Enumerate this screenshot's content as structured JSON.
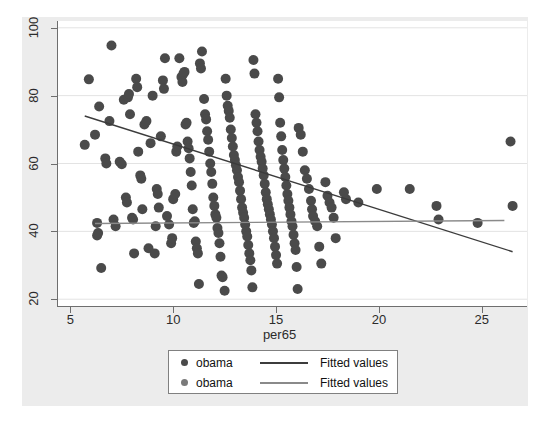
{
  "figure": {
    "background_color": "#ececec",
    "plot_background_color": "#ffffff",
    "gridline_color": "#e3e3e3",
    "axis_color": "#6e6e6e"
  },
  "axes": {
    "x_title": "per65",
    "x_ticks": [
      "5",
      "10",
      "15",
      "20",
      "25"
    ],
    "y_ticks": [
      "20",
      "40",
      "60",
      "80",
      "100"
    ]
  },
  "legend": {
    "rows": [
      {
        "marker_label": "obama",
        "line_label": "Fitted values",
        "marker_color": "#4a4a4a",
        "line_color": "#3c3c3c"
      },
      {
        "marker_label": "obama",
        "line_label": "Fitted values",
        "marker_color": "#7a7a7a",
        "line_color": "#8a8a8a"
      }
    ]
  },
  "chart_data": {
    "type": "scatter",
    "title": "",
    "subtitle": "",
    "xlabel": "per65",
    "ylabel": "",
    "xlim": [
      4.4,
      27.2
    ],
    "ylim": [
      18.0,
      102.0
    ],
    "xticks": [
      5,
      10,
      15,
      20,
      25
    ],
    "yticks": [
      20,
      40,
      60,
      80,
      100
    ],
    "grid": true,
    "grid_axis": "y",
    "legend_position": "below-plot",
    "marker_color": "#4a4a4a",
    "marker_size": 5,
    "series": [
      {
        "name": "obama",
        "type": "scatter",
        "color": "#4a4a4a",
        "points": [
          [
            5.7,
            65.5
          ],
          [
            5.9,
            84.8
          ],
          [
            6.2,
            68.5
          ],
          [
            6.3,
            42.5
          ],
          [
            6.3,
            38.8
          ],
          [
            6.35,
            39.5
          ],
          [
            6.4,
            76.8
          ],
          [
            6.5,
            29.2
          ],
          [
            6.7,
            61.5
          ],
          [
            6.75,
            60.0
          ],
          [
            6.9,
            72.5
          ],
          [
            7.0,
            94.8
          ],
          [
            7.1,
            43.5
          ],
          [
            7.2,
            41.5
          ],
          [
            7.4,
            60.5
          ],
          [
            7.5,
            59.8
          ],
          [
            7.6,
            78.8
          ],
          [
            7.7,
            50.0
          ],
          [
            7.75,
            48.5
          ],
          [
            7.8,
            79.5
          ],
          [
            7.85,
            80.5
          ],
          [
            7.9,
            74.5
          ],
          [
            8.0,
            44.0
          ],
          [
            8.05,
            43.5
          ],
          [
            8.1,
            33.5
          ],
          [
            8.2,
            85.0
          ],
          [
            8.25,
            82.5
          ],
          [
            8.3,
            63.5
          ],
          [
            8.4,
            56.5
          ],
          [
            8.45,
            55.5
          ],
          [
            8.5,
            46.5
          ],
          [
            8.6,
            71.5
          ],
          [
            8.7,
            72.5
          ],
          [
            8.8,
            35.0
          ],
          [
            8.9,
            66.0
          ],
          [
            9.0,
            80.0
          ],
          [
            9.1,
            33.5
          ],
          [
            9.15,
            41.5
          ],
          [
            9.2,
            52.5
          ],
          [
            9.25,
            51.0
          ],
          [
            9.3,
            47.0
          ],
          [
            9.4,
            68.0
          ],
          [
            9.5,
            84.5
          ],
          [
            9.55,
            82.0
          ],
          [
            9.6,
            91.0
          ],
          [
            9.7,
            44.5
          ],
          [
            9.8,
            42.0
          ],
          [
            9.9,
            36.5
          ],
          [
            9.95,
            38.0
          ],
          [
            10.0,
            49.5
          ],
          [
            10.1,
            51.0
          ],
          [
            10.15,
            63.5
          ],
          [
            10.2,
            65.0
          ],
          [
            10.3,
            91.0
          ],
          [
            10.4,
            85.5
          ],
          [
            10.45,
            84.0
          ],
          [
            10.5,
            86.5
          ],
          [
            10.55,
            87.0
          ],
          [
            10.6,
            71.5
          ],
          [
            10.65,
            72.0
          ],
          [
            10.7,
            66.5
          ],
          [
            10.75,
            64.5
          ],
          [
            10.8,
            61.5
          ],
          [
            10.85,
            57.5
          ],
          [
            10.9,
            53.5
          ],
          [
            10.95,
            46.5
          ],
          [
            11.0,
            42.5
          ],
          [
            11.05,
            43.0
          ],
          [
            11.1,
            37.0
          ],
          [
            11.15,
            35.0
          ],
          [
            11.2,
            33.5
          ],
          [
            11.25,
            24.5
          ],
          [
            11.3,
            89.5
          ],
          [
            11.35,
            88.0
          ],
          [
            11.4,
            93.0
          ],
          [
            11.5,
            79.0
          ],
          [
            11.55,
            74.5
          ],
          [
            11.6,
            73.0
          ],
          [
            11.65,
            69.5
          ],
          [
            11.7,
            67.0
          ],
          [
            11.75,
            63.5
          ],
          [
            11.8,
            60.0
          ],
          [
            11.85,
            57.5
          ],
          [
            11.9,
            54.0
          ],
          [
            11.95,
            50.0
          ],
          [
            12.0,
            47.5
          ],
          [
            12.05,
            45.0
          ],
          [
            12.1,
            44.0
          ],
          [
            12.15,
            41.0
          ],
          [
            12.2,
            39.5
          ],
          [
            12.25,
            36.5
          ],
          [
            12.3,
            32.5
          ],
          [
            12.35,
            27.0
          ],
          [
            12.4,
            26.5
          ],
          [
            12.5,
            22.5
          ],
          [
            12.55,
            85.0
          ],
          [
            12.6,
            80.0
          ],
          [
            12.65,
            77.0
          ],
          [
            12.7,
            75.5
          ],
          [
            12.75,
            73.5
          ],
          [
            12.8,
            70.0
          ],
          [
            12.85,
            67.5
          ],
          [
            12.9,
            65.0
          ],
          [
            12.95,
            62.5
          ],
          [
            13.0,
            61.0
          ],
          [
            13.05,
            59.5
          ],
          [
            13.1,
            58.0
          ],
          [
            13.15,
            56.0
          ],
          [
            13.2,
            54.5
          ],
          [
            13.25,
            52.0
          ],
          [
            13.3,
            49.5
          ],
          [
            13.35,
            47.0
          ],
          [
            13.4,
            45.5
          ],
          [
            13.45,
            44.0
          ],
          [
            13.5,
            42.0
          ],
          [
            13.55,
            40.0
          ],
          [
            13.6,
            38.5
          ],
          [
            13.65,
            36.0
          ],
          [
            13.7,
            33.5
          ],
          [
            13.75,
            31.5
          ],
          [
            13.8,
            28.5
          ],
          [
            13.85,
            23.5
          ],
          [
            13.9,
            90.5
          ],
          [
            13.95,
            86.5
          ],
          [
            14.0,
            74.5
          ],
          [
            14.05,
            72.0
          ],
          [
            14.1,
            69.5
          ],
          [
            14.15,
            66.5
          ],
          [
            14.2,
            64.0
          ],
          [
            14.25,
            62.0
          ],
          [
            14.3,
            60.5
          ],
          [
            14.35,
            58.5
          ],
          [
            14.4,
            56.5
          ],
          [
            14.45,
            54.0
          ],
          [
            14.5,
            51.5
          ],
          [
            14.55,
            49.5
          ],
          [
            14.6,
            48.0
          ],
          [
            14.65,
            46.5
          ],
          [
            14.7,
            45.0
          ],
          [
            14.75,
            43.5
          ],
          [
            14.8,
            42.0
          ],
          [
            14.85,
            40.0
          ],
          [
            14.9,
            38.0
          ],
          [
            14.95,
            35.5
          ],
          [
            15.0,
            33.0
          ],
          [
            15.05,
            30.5
          ],
          [
            15.1,
            85.0
          ],
          [
            15.15,
            79.5
          ],
          [
            15.2,
            72.0
          ],
          [
            15.25,
            68.0
          ],
          [
            15.3,
            64.0
          ],
          [
            15.35,
            61.0
          ],
          [
            15.4,
            58.5
          ],
          [
            15.45,
            56.0
          ],
          [
            15.5,
            53.5
          ],
          [
            15.55,
            51.0
          ],
          [
            15.6,
            49.0
          ],
          [
            15.65,
            47.0
          ],
          [
            15.7,
            45.0
          ],
          [
            15.75,
            43.0
          ],
          [
            15.8,
            41.5
          ],
          [
            15.85,
            39.0
          ],
          [
            15.9,
            36.5
          ],
          [
            15.95,
            34.5
          ],
          [
            16.0,
            29.5
          ],
          [
            16.05,
            23.0
          ],
          [
            16.1,
            70.5
          ],
          [
            16.2,
            68.5
          ],
          [
            16.3,
            63.5
          ],
          [
            16.4,
            58.0
          ],
          [
            16.5,
            55.5
          ],
          [
            16.6,
            52.5
          ],
          [
            16.7,
            49.0
          ],
          [
            16.75,
            46.5
          ],
          [
            16.8,
            44.5
          ],
          [
            16.9,
            43.0
          ],
          [
            17.0,
            41.5
          ],
          [
            17.1,
            35.5
          ],
          [
            17.2,
            30.5
          ],
          [
            17.4,
            54.5
          ],
          [
            17.5,
            50.5
          ],
          [
            17.6,
            48.5
          ],
          [
            17.7,
            47.0
          ],
          [
            17.8,
            44.0
          ],
          [
            17.9,
            38.0
          ],
          [
            18.3,
            51.5
          ],
          [
            18.4,
            49.5
          ],
          [
            19.0,
            48.5
          ],
          [
            19.9,
            52.5
          ],
          [
            21.5,
            52.5
          ],
          [
            22.8,
            47.5
          ],
          [
            22.9,
            43.5
          ],
          [
            24.8,
            42.5
          ],
          [
            26.4,
            66.5
          ],
          [
            26.5,
            47.5
          ]
        ]
      },
      {
        "name": "obama",
        "type": "scatter",
        "color": "#7a7a7a",
        "points": []
      }
    ],
    "fitted_lines": [
      {
        "name": "Fitted values",
        "color": "#3c3c3c",
        "x_start": 5.7,
        "y_start": 74.0,
        "x_end": 26.5,
        "y_end": 34.0,
        "slope": -1.92,
        "intercept": 85.0
      },
      {
        "name": "Fitted values",
        "color": "#8a8a8a",
        "x_start": 6.2,
        "y_start": 42.3,
        "x_end": 26.1,
        "y_end": 43.2,
        "slope": 0.045,
        "intercept": 42.0
      }
    ]
  }
}
